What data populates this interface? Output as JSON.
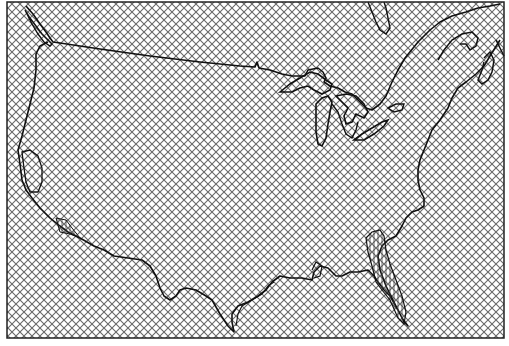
{
  "map": {
    "subject": "Contiguous United States outline",
    "fill_pattern": "diagonal crosshatch",
    "colors": {
      "background": "#ffffff",
      "hatch": "#6a6a6a",
      "outline": "#111111",
      "frame": "#222222"
    },
    "features": [
      "national-coastline",
      "canada-border",
      "great-lakes",
      "florida-peninsula-hatched-region",
      "california-coastal-region",
      "chesapeake-bay",
      "new-england-coast"
    ],
    "labels": []
  }
}
